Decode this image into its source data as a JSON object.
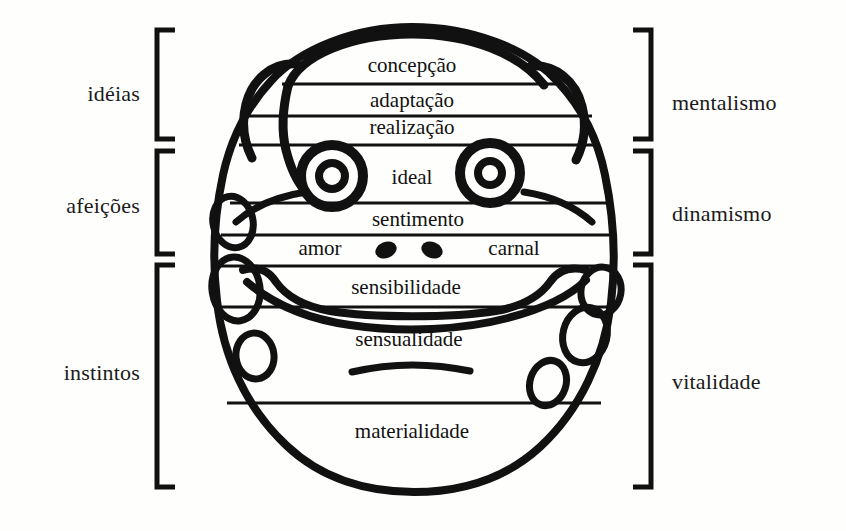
{
  "diagram": {
    "language": "pt-BR",
    "ink_color": "#111111",
    "background_color": "#fefefd",
    "left_groups": [
      {
        "label": "idéias",
        "bracket_top": 28,
        "bracket_bottom": 141,
        "text_y": 95
      },
      {
        "label": "afeições",
        "bracket_top": 149,
        "bracket_bottom": 256,
        "text_y": 207
      },
      {
        "label": "instintos",
        "bracket_top": 263,
        "bracket_bottom": 489,
        "text_y": 374
      }
    ],
    "right_groups": [
      {
        "label": "mentalismo",
        "bracket_top": 28,
        "bracket_bottom": 141,
        "text_y": 104
      },
      {
        "label": "dinamismo",
        "bracket_top": 149,
        "bracket_bottom": 256,
        "text_y": 215
      },
      {
        "label": "vitalidade",
        "bracket_top": 263,
        "bracket_bottom": 489,
        "text_y": 383
      }
    ],
    "zones": [
      {
        "label": "concepção",
        "x": 412,
        "y": 68,
        "group": "idéias"
      },
      {
        "label": "adaptação",
        "x": 412,
        "y": 103,
        "group": "idéias"
      },
      {
        "label": "realização",
        "x": 412,
        "y": 130,
        "group": "idéias"
      },
      {
        "label": "ideal",
        "x": 412,
        "y": 179,
        "group": "afeições"
      },
      {
        "label": "sentimento",
        "x": 418,
        "y": 222,
        "group": "afeições"
      },
      {
        "label": "amor",
        "x": 320,
        "y": 250,
        "group": "afeições"
      },
      {
        "label": "carnal",
        "x": 514,
        "y": 250,
        "group": "afeições"
      },
      {
        "label": "sensibilidade",
        "x": 406,
        "y": 290,
        "group": "instintos"
      },
      {
        "label": "sensualidade",
        "x": 409,
        "y": 342,
        "group": "instintos"
      },
      {
        "label": "materialidade",
        "x": 412,
        "y": 434,
        "group": "instintos"
      }
    ],
    "division_lines": [
      {
        "name": "concepcao-adaptacao",
        "y": 84
      },
      {
        "name": "adaptacao-realizacao",
        "y": 116
      },
      {
        "name": "realizacao-ideal",
        "y": 145
      },
      {
        "name": "ideal-sentimento",
        "y": 203
      },
      {
        "name": "sentimento-amor",
        "y": 235
      },
      {
        "name": "amor-sensibilidade",
        "y": 266
      },
      {
        "name": "sensibilidade-sensualidade",
        "y": 307
      },
      {
        "name": "sensualidade-materialidade",
        "y": 403
      }
    ]
  }
}
